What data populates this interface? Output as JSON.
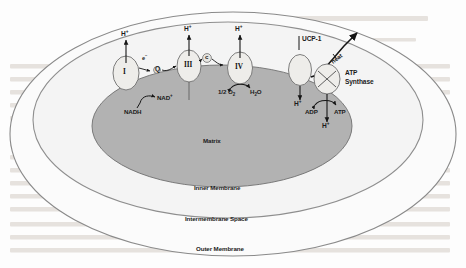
{
  "figure": {
    "compartments": {
      "matrix": "Matrix",
      "inner_membrane": "Inner Membrane",
      "intermembrane_space": "Intermembrane Space",
      "outer_membrane": "Outer Membrane"
    },
    "complexes": [
      {
        "id": "complex-i",
        "label": "I"
      },
      {
        "id": "complex-iii",
        "label": "III"
      },
      {
        "id": "complex-iv",
        "label": "IV"
      },
      {
        "id": "ucp1-channel",
        "label": ""
      },
      {
        "id": "atp-synthase",
        "label": ""
      }
    ],
    "carriers": [
      {
        "id": "ubiquinone",
        "label": "Q"
      },
      {
        "id": "cytochrome-c",
        "label": "c"
      },
      {
        "id": "electron",
        "label": "e",
        "charge": "−"
      }
    ],
    "proton_labels": [
      {
        "id": "proton-complex-i",
        "text": "H",
        "charge": "+"
      },
      {
        "id": "proton-complex-iii",
        "text": "H",
        "charge": "+"
      },
      {
        "id": "proton-complex-iv",
        "text": "H",
        "charge": "+"
      },
      {
        "id": "proton-ucp1",
        "text": "H",
        "charge": "+"
      },
      {
        "id": "proton-atp-synthase",
        "text": "H",
        "charge": "+"
      }
    ],
    "substrates": {
      "nadh": "NADH",
      "nad_plus": "NAD",
      "nad_plus_charge": "+",
      "half_oxygen_coeff": "1/2 O",
      "half_oxygen_sub": "2",
      "water": "H",
      "water_sub": "2",
      "water_tail": "O",
      "adp": "ADP",
      "atp": "ATP"
    },
    "annotations": {
      "ucp1": "UCP-1",
      "heat": "heat",
      "atp_synthase_line1": "ATP",
      "atp_synthase_line2": "Synthase"
    },
    "colors": {
      "matrix_fill": "#b0b0b0",
      "inner_space_fill": "#f2f2f2",
      "outer_space_fill": "#fbfbfb",
      "membrane_stroke": "#8a8a8a",
      "protein_fill": "#ededea",
      "protein_stroke": "#777777",
      "text": "#1b1b1b",
      "page_bleed": "#e9e6e2"
    }
  }
}
